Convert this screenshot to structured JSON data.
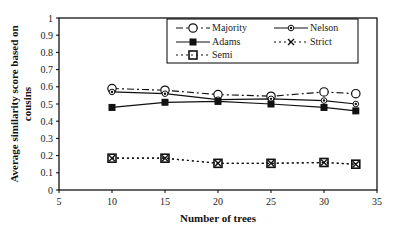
{
  "chart_data": {
    "type": "line",
    "title": "",
    "xlabel": "Number of trees",
    "ylabel_lines": [
      "Average similarity score based on",
      "cousins"
    ],
    "xlim": [
      5,
      35
    ],
    "ylim": [
      0,
      1
    ],
    "xticks": [
      5,
      10,
      15,
      20,
      25,
      30,
      35
    ],
    "yticks": [
      0,
      0.1,
      0.2,
      0.3,
      0.4,
      0.5,
      0.6,
      0.7,
      0.8,
      0.9,
      1
    ],
    "ytick_labels": [
      "0",
      "0.1",
      "0.2",
      "0.3",
      "0.4",
      "0.5",
      "0.6",
      "0.7",
      "0.8",
      "0.9",
      "1"
    ],
    "xtick_labels": [
      "5",
      "10",
      "15",
      "20",
      "25",
      "30",
      "35"
    ],
    "grid": false,
    "legend_position": "top-right",
    "x": [
      10,
      15,
      20,
      25,
      30,
      33
    ],
    "series": [
      {
        "name": "Majority",
        "marker": "open-circle",
        "line": "dash-dot",
        "values": [
          0.59,
          0.58,
          0.555,
          0.545,
          0.57,
          0.56
        ]
      },
      {
        "name": "Nelson",
        "marker": "small-diamond",
        "line": "solid",
        "values": [
          0.57,
          0.56,
          0.525,
          0.53,
          0.52,
          0.5
        ]
      },
      {
        "name": "Adams",
        "marker": "filled-square",
        "line": "solid",
        "values": [
          0.48,
          0.51,
          0.515,
          0.5,
          0.48,
          0.46
        ]
      },
      {
        "name": "Strict",
        "marker": "x",
        "line": "dotted",
        "values": [
          0.185,
          0.185,
          0.155,
          0.155,
          0.16,
          0.15
        ]
      },
      {
        "name": "Semi",
        "marker": "open-square",
        "line": "dotted",
        "values": [
          0.185,
          0.185,
          0.155,
          0.155,
          0.16,
          0.15
        ]
      }
    ]
  }
}
